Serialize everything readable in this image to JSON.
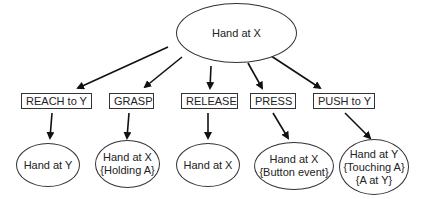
{
  "root": {
    "label": "Hand at X"
  },
  "actions": [
    {
      "label": "REACH to Y",
      "result": [
        "Hand at Y"
      ]
    },
    {
      "label": "GRASP",
      "result": [
        "Hand at X",
        "{Holding A}"
      ]
    },
    {
      "label": "RELEASE",
      "result": [
        "Hand at X"
      ]
    },
    {
      "label": "PRESS",
      "result": [
        "Hand at X",
        "{Button event}"
      ]
    },
    {
      "label": "PUSH to Y",
      "result": [
        "Hand at Y",
        "{Touching A}",
        "{A at Y}"
      ]
    }
  ],
  "colors": {
    "stroke": "#222222",
    "background": "#ffffff"
  }
}
